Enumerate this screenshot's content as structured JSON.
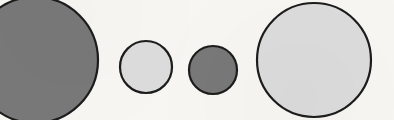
{
  "figure": {
    "background_color": "#f7f6f3",
    "width": 394,
    "height": 120,
    "outline_color": "#1c1c1c",
    "outline_width": 2.2,
    "palette": {
      "dark_gray_fill": "#787878",
      "light_gray_fill": "#dcdcdc"
    }
  },
  "chart_data": {
    "type": "scatter",
    "subtitle": "",
    "xlabel": "",
    "ylabel": "",
    "xlim": [
      0,
      394
    ],
    "ylim": [
      0,
      120
    ],
    "grid": false,
    "legend": "none",
    "units": "pixels",
    "categories": [
      "circle-1",
      "circle-2",
      "circle-3",
      "circle-4"
    ],
    "values": [
      63,
      26,
      24,
      57
    ],
    "series": [
      {
        "name": "radius",
        "values": [
          63,
          26,
          24,
          57
        ]
      },
      {
        "name": "diameter",
        "values": [
          126,
          52,
          48,
          114
        ]
      },
      {
        "name": "center_x",
        "values": [
          35,
          146,
          213,
          314
        ]
      },
      {
        "name": "center_y",
        "values": [
          60,
          67,
          70,
          60
        ]
      }
    ],
    "points": [
      {
        "label": "circle-1",
        "order": 1,
        "cx": 35,
        "cy": 60,
        "r": 63,
        "diameter": 126,
        "fill": "#787878",
        "fill_name": "dark gray",
        "stroke": "#1c1c1c",
        "stroke_width": 2.2,
        "clipped": "left, top and bottom edges",
        "size_rank": 1
      },
      {
        "label": "circle-2",
        "order": 2,
        "cx": 146,
        "cy": 67,
        "r": 26,
        "diameter": 52,
        "fill": "#dcdcdc",
        "fill_name": "light gray",
        "stroke": "#1c1c1c",
        "stroke_width": 2.2,
        "clipped": "none",
        "size_rank": 3
      },
      {
        "label": "circle-3",
        "order": 3,
        "cx": 213,
        "cy": 70,
        "r": 24,
        "diameter": 48,
        "fill": "#787878",
        "fill_name": "dark gray",
        "stroke": "#1c1c1c",
        "stroke_width": 2.2,
        "clipped": "none",
        "size_rank": 4
      },
      {
        "label": "circle-4",
        "order": 4,
        "cx": 314,
        "cy": 60,
        "r": 57,
        "diameter": 114,
        "fill": "#dcdcdc",
        "fill_name": "light gray",
        "stroke": "#1c1c1c",
        "stroke_width": 2.2,
        "clipped": "bottom edge",
        "size_rank": 2
      }
    ]
  }
}
